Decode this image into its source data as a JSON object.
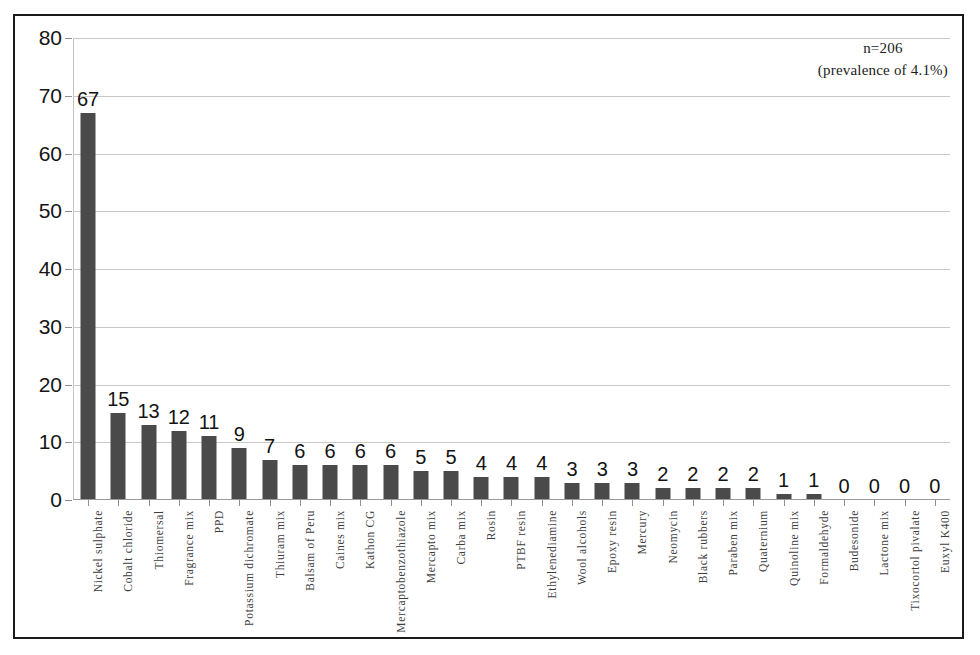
{
  "annotation": {
    "line1": "n=206",
    "line2": "(prevalence of 4.1%)"
  },
  "chart_data": {
    "type": "bar",
    "title": "",
    "subtitle": "",
    "xlabel": "",
    "ylabel": "",
    "ylim": [
      0,
      80
    ],
    "ytick_step": 10,
    "yticks": [
      0,
      10,
      20,
      30,
      40,
      50,
      60,
      70,
      80
    ],
    "grid": true,
    "legend": false,
    "bar_color": "#4a4a4a",
    "gridline_color": "#c9c9c9",
    "frame_color": "#1a1a1a",
    "annotations": [
      "n=206",
      "(prevalence of 4.1%)"
    ],
    "categories": [
      "Nickel sulphate",
      "Cobalt chloride",
      "Thiomersal",
      "Fragrance mix",
      "PPD",
      "Potassium dichromate",
      "Thiuram mix",
      "Balsam of Peru",
      "Caines mix",
      "Kathon CG",
      "Mercaptobenzothiazole",
      "Mercapto mix",
      "Carba mix",
      "Rosin",
      "PTBF resin",
      "Ethylenediamine",
      "Wool alcohols",
      "Epoxy resin",
      "Mercury",
      "Neomycin",
      "Black rubbers",
      "Paraben mix",
      "Quaternium",
      "Quinoline mix",
      "Formaldehyde",
      "Budesonide",
      "Lactone mix",
      "Tixocortol pivalate",
      "Euxyl K400"
    ],
    "values": [
      67,
      15,
      13,
      12,
      11,
      9,
      7,
      6,
      6,
      6,
      6,
      5,
      5,
      4,
      4,
      4,
      3,
      3,
      3,
      2,
      2,
      2,
      2,
      1,
      1,
      0,
      0,
      0,
      0
    ]
  }
}
